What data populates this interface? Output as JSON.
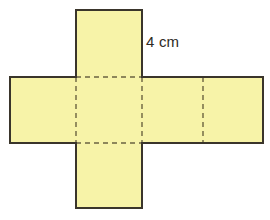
{
  "figure": {
    "kind": "cube-net-diagram",
    "background_color": "#ffffff",
    "face_fill_color": "#f7f3a8",
    "outline_color": "#3a352b",
    "fold_line_color": "#6b6340",
    "label_color": "#2e2a24",
    "unit_square_px": 66
  },
  "labels": {
    "edge_length": "4 cm"
  },
  "net": {
    "description": "Plus-sign shaped net of a cube with six square faces",
    "faces": [
      {
        "name": "top-flap-face",
        "x": 76,
        "y": 10,
        "w": 66,
        "h": 67
      },
      {
        "name": "left-face",
        "x": 10,
        "y": 77,
        "w": 66,
        "h": 66
      },
      {
        "name": "front-face",
        "x": 76,
        "y": 77,
        "w": 66,
        "h": 66
      },
      {
        "name": "right-face",
        "x": 142,
        "y": 77,
        "w": 61,
        "h": 66
      },
      {
        "name": "back-face",
        "x": 203,
        "y": 77,
        "w": 60,
        "h": 66
      },
      {
        "name": "bottom-flap-face",
        "x": 76,
        "y": 143,
        "w": 66,
        "h": 65
      }
    ],
    "outline_path": "M 76 10 L 142 10 L 142 77 L 263 77 L 263 143 L 142 143 L 142 208 L 76 208 L 76 143 L 10 143 L 10 77 L 76 77 Z",
    "fold_lines": [
      {
        "name": "fold-vertical-left",
        "x1": 76,
        "y1": 77,
        "x2": 76,
        "y2": 143
      },
      {
        "name": "fold-vertical-middle",
        "x1": 142,
        "y1": 77,
        "x2": 142,
        "y2": 143
      },
      {
        "name": "fold-vertical-right",
        "x1": 203,
        "y1": 77,
        "x2": 203,
        "y2": 143
      },
      {
        "name": "fold-horizontal-top",
        "x1": 76,
        "y1": 77,
        "x2": 263,
        "y2": 77
      },
      {
        "name": "fold-horizontal-bottom",
        "x1": 76,
        "y1": 143,
        "x2": 263,
        "y2": 143
      }
    ]
  }
}
